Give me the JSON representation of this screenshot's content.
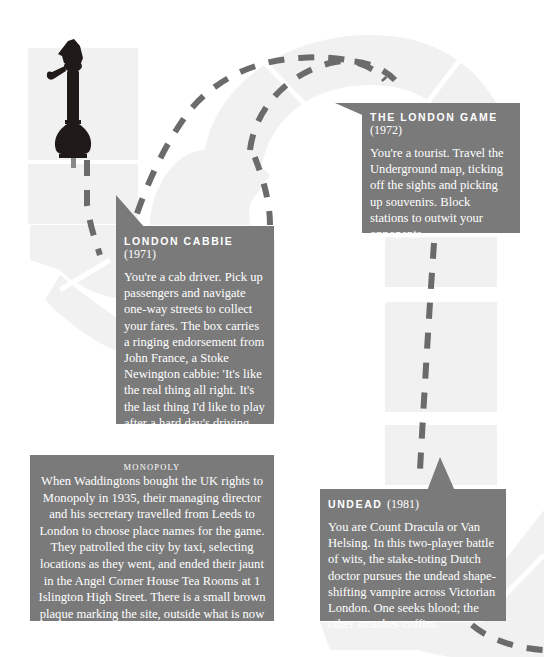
{
  "colors": {
    "card_bg": "#7a7a7a",
    "card_text": "#ffffff",
    "path_dash": "#6b6b6b",
    "board_track": "#f1f1f1",
    "page_bg": "#ffffff",
    "pawn": "#1f1a17"
  },
  "illustration": {
    "pawn_icon": "sherlock-holmes-pawn-with-pipe"
  },
  "cards": {
    "london_game": {
      "title": "The London Game",
      "year": "(1972)",
      "body": "You're a tourist. Travel the Underground map, ticking off the sights and picking up souvenirs. Block stations to outwit your opponents."
    },
    "london_cabbie": {
      "title": "London Cabbie",
      "year": "(1971)",
      "body": "You're a cab driver. Pick up passengers and navigate one-way streets to collect your fares. The box carries a ringing endorsement from John France, a Stoke Newington cabbie: 'It's like the real thing all right. It's the last thing I'd like to play after a hard day's driving around town.'"
    },
    "undead": {
      "title": "Undead",
      "year": "(1981)",
      "body": "You are Count Dracula or Van Helsing. In this two-player battle of wits, the stake-toting Dutch doctor pursues the undead shape-shifting vampire across Victorian London. One seeks blood; the other smashes coffins."
    },
    "monopoly": {
      "title": "Monopoly",
      "body": "When Waddingtons bought the UK rights to Monopoly in 1935, their managing director and his secretary travelled from Leeds to London to choose place names for the game. They patrolled the city by taxi, selecting locations as they went, and ended their jaunt in the Angel Corner House Tea Rooms at 1 Islington High Street. There is a small brown plaque marking the site, outside what is now a branch of the Co-op Bank.",
      "footnote": "1"
    }
  }
}
